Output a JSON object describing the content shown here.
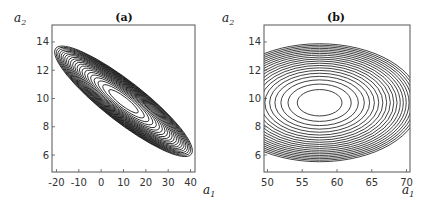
{
  "chart_data": [
    {
      "type": "contour",
      "title": "(a)",
      "xlabel": "a1",
      "ylabel": "a2",
      "xlim": [
        -22,
        42
      ],
      "ylim": [
        4.8,
        15.2
      ],
      "xticks": [
        -20,
        -10,
        0,
        10,
        20,
        30,
        40
      ],
      "yticks": [
        6,
        8,
        10,
        12,
        14
      ],
      "center": [
        10,
        9.8
      ],
      "levels": 22,
      "orientation": "tilted ellipses, negatively correlated",
      "extent": {
        "a1": [
          -12,
          33
        ],
        "a2": [
          5.8,
          13.9
        ]
      },
      "grid": false
    },
    {
      "type": "contour",
      "title": "(b)",
      "xlabel": "a1",
      "ylabel": "a2",
      "xlim": [
        49.5,
        70.5
      ],
      "ylim": [
        4.8,
        15.2
      ],
      "xticks": [
        50,
        55,
        60,
        65,
        70
      ],
      "yticks": [
        6,
        8,
        10,
        12,
        14
      ],
      "center": [
        57.5,
        9.7
      ],
      "levels": 20,
      "orientation": "axis-aligned ellipses",
      "extent": {
        "a1": [
          49.5,
          70.5
        ],
        "a2": [
          5.7,
          13.9
        ]
      },
      "grid": false
    }
  ],
  "panels": {
    "a": {
      "title": "(a)",
      "xlabel": "a",
      "xsub": "1",
      "ylabel": "a",
      "ysub": "2",
      "xticks": [
        "-20",
        "-10",
        "0",
        "10",
        "20",
        "30",
        "40"
      ],
      "yticks": [
        "14",
        "12",
        "10",
        "8",
        "6"
      ]
    },
    "b": {
      "title": "(b)",
      "xlabel": "a",
      "xsub": "1",
      "ylabel": "a",
      "ysub": "2",
      "xticks": [
        "50",
        "55",
        "60",
        "65",
        "70"
      ],
      "yticks": [
        "14",
        "12",
        "10",
        "8",
        "6"
      ]
    }
  }
}
